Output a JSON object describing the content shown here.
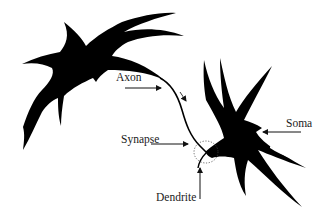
{
  "diagram": {
    "title": "",
    "labels": {
      "axon": "Axon",
      "synapse": "Synapse",
      "dendrite": "Dendrite",
      "soma": "Soma"
    },
    "colors": {
      "ink": "#000000",
      "text": "#1a1a1a",
      "background": "#ffffff"
    },
    "elements": [
      {
        "id": "neuron-presynaptic",
        "kind": "neuron",
        "position": "top-left"
      },
      {
        "id": "axon",
        "kind": "curve",
        "from": "neuron-presynaptic",
        "to": "synapse"
      },
      {
        "id": "synapse",
        "kind": "dotted-circle",
        "position": "center-bottom"
      },
      {
        "id": "neuron-postsynaptic",
        "kind": "neuron",
        "position": "right"
      }
    ],
    "arrows": [
      {
        "label": "Axon",
        "direction": "right"
      },
      {
        "label": "Synapse",
        "direction": "right"
      },
      {
        "label": "Dendrite",
        "direction": "up"
      },
      {
        "label": "Soma",
        "direction": "left"
      },
      {
        "label": "signal-direction",
        "direction": "down-right"
      }
    ]
  }
}
